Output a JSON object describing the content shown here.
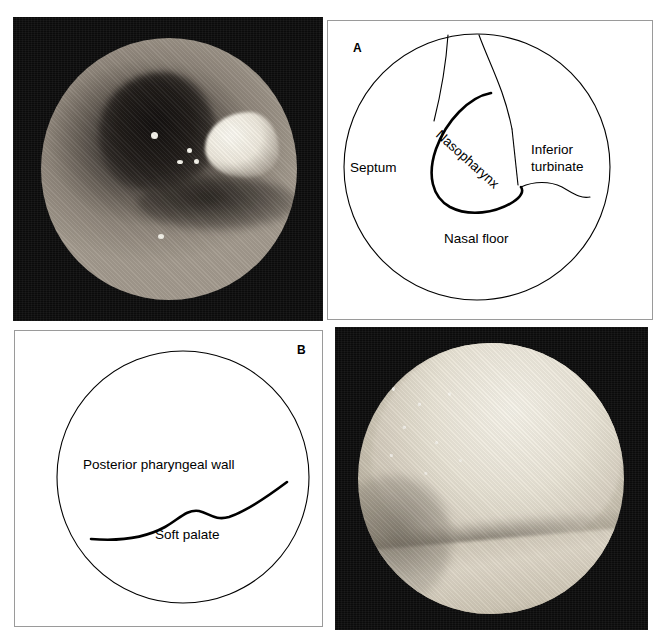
{
  "figure": {
    "background_color": "#ffffff",
    "photo_background_color": "#0b0b0b",
    "ink_color": "#000000",
    "panel_border_color": "#9a9a9a"
  },
  "panels": [
    {
      "id": "top-left-photo",
      "kind": "photograph",
      "letter": "",
      "description": "Endoscopic view of the nasal cavity showing the nasopharynx opening, septum and inferior turbinate with specular light reflections"
    },
    {
      "id": "panel-a-diagram",
      "kind": "diagram",
      "letter": "A",
      "labels": [
        {
          "name": "septum",
          "text": "Septum"
        },
        {
          "name": "nasopharynx",
          "text": "Nasopharynx"
        },
        {
          "name": "inferior-turbinate-line1",
          "text": "Inferior"
        },
        {
          "name": "inferior-turbinate-line2",
          "text": "turbinate"
        },
        {
          "name": "nasal-floor",
          "text": "Nasal floor"
        }
      ]
    },
    {
      "id": "panel-b-diagram",
      "kind": "diagram",
      "letter": "B",
      "labels": [
        {
          "name": "posterior-pharyngeal-wall",
          "text": "Posterior pharyngeal wall"
        },
        {
          "name": "soft-palate",
          "text": "Soft palate"
        }
      ]
    },
    {
      "id": "bottom-right-photo",
      "kind": "photograph",
      "letter": "",
      "description": "Endoscopic view of the nasopharynx showing the posterior pharyngeal wall above and the soft palate below"
    }
  ]
}
